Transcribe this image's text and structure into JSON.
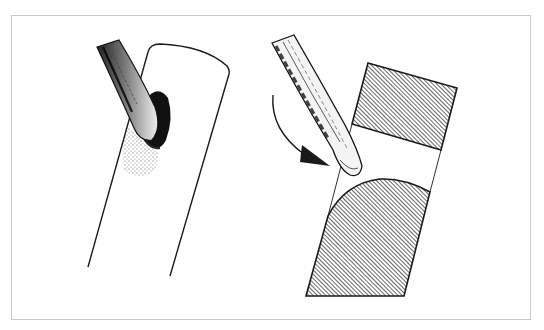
{
  "figure": {
    "type": "line-illustration",
    "panels": [
      {
        "id": "left",
        "description": "Knife blade pressed against a cylindrical stem making a slanted cut, dark shaded notch",
        "elements": [
          "knife-blade",
          "cylinder-stem",
          "cut-shadow"
        ]
      },
      {
        "id": "right",
        "description": "Knife blade rotating (curved arrow) through a stem shown in cross-section with hatched upper and lower parts",
        "elements": [
          "knife-blade",
          "rotation-arrow",
          "upper-hatched-section",
          "lower-hatched-section",
          "stem-outline"
        ]
      }
    ],
    "colors": {
      "ink": "#1a1a1a",
      "frame_border": "#c8c8c8",
      "background": "#ffffff"
    }
  }
}
